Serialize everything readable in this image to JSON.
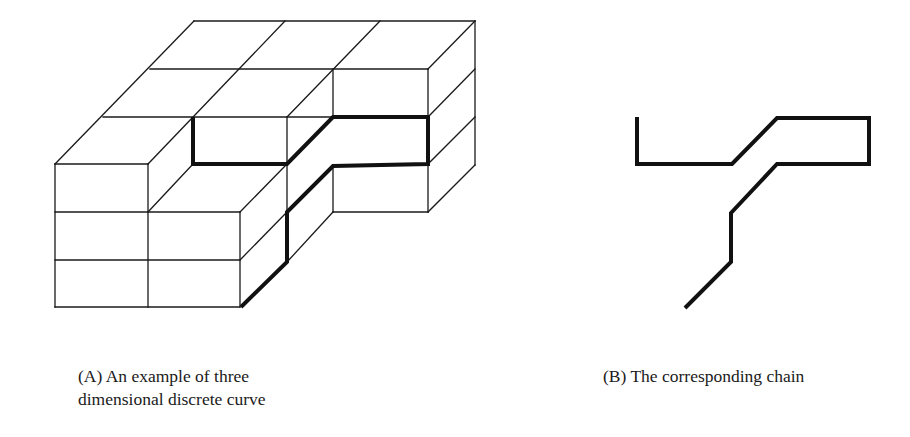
{
  "figure": {
    "panel_a": {
      "caption_lines": [
        "(A) An example of three",
        "dimensional discrete curve"
      ],
      "thin_lines": [
        [
          194,
          21,
          475,
          21
        ],
        [
          150,
          69,
          428,
          69
        ],
        [
          103,
          117,
          333,
          117
        ],
        [
          55,
          164,
          148,
          164
        ],
        [
          55,
          164,
          194,
          21
        ],
        [
          148,
          164,
          285,
          21
        ],
        [
          287,
          117,
          380,
          21
        ],
        [
          428,
          69,
          475,
          21
        ],
        [
          428,
          117,
          475,
          69
        ],
        [
          428,
          164,
          475,
          117
        ],
        [
          428,
          212,
          475,
          165
        ],
        [
          475,
          21,
          475,
          165
        ],
        [
          428,
          69,
          428,
          117
        ],
        [
          428,
          164,
          428,
          212
        ],
        [
          333,
          69,
          333,
          117
        ],
        [
          333,
          166,
          333,
          212
        ],
        [
          333,
          212,
          428,
          212
        ],
        [
          287,
          117,
          287,
          212
        ],
        [
          55,
          164,
          55,
          307
        ],
        [
          148,
          164,
          148,
          307
        ],
        [
          240,
          212,
          240,
          307
        ],
        [
          55,
          307,
          240,
          307
        ],
        [
          55,
          212,
          240,
          212
        ],
        [
          55,
          260,
          240,
          260
        ],
        [
          148,
          212,
          193,
          164
        ],
        [
          240,
          212,
          287,
          164
        ],
        [
          240,
          260,
          287,
          212
        ],
        [
          287,
          262,
          333,
          212
        ]
      ],
      "curve_path": [
        [
          241,
          307
        ],
        [
          287,
          262
        ],
        [
          287,
          212
        ],
        [
          333,
          166
        ],
        [
          428,
          164
        ],
        [
          428,
          117
        ],
        [
          333,
          117
        ],
        [
          287,
          164
        ],
        [
          193,
          164
        ],
        [
          193,
          117
        ]
      ]
    },
    "panel_b": {
      "caption": "(B) The corresponding chain",
      "chain_path": [
        [
          637,
          117
        ],
        [
          637,
          164
        ],
        [
          732,
          164
        ],
        [
          777,
          118
        ],
        [
          869,
          118
        ],
        [
          869,
          164
        ],
        [
          777,
          164
        ],
        [
          731,
          213
        ],
        [
          731,
          262
        ],
        [
          685,
          308
        ]
      ]
    },
    "colors": {
      "background": "#ffffff",
      "line": "#1a1a1a"
    }
  }
}
